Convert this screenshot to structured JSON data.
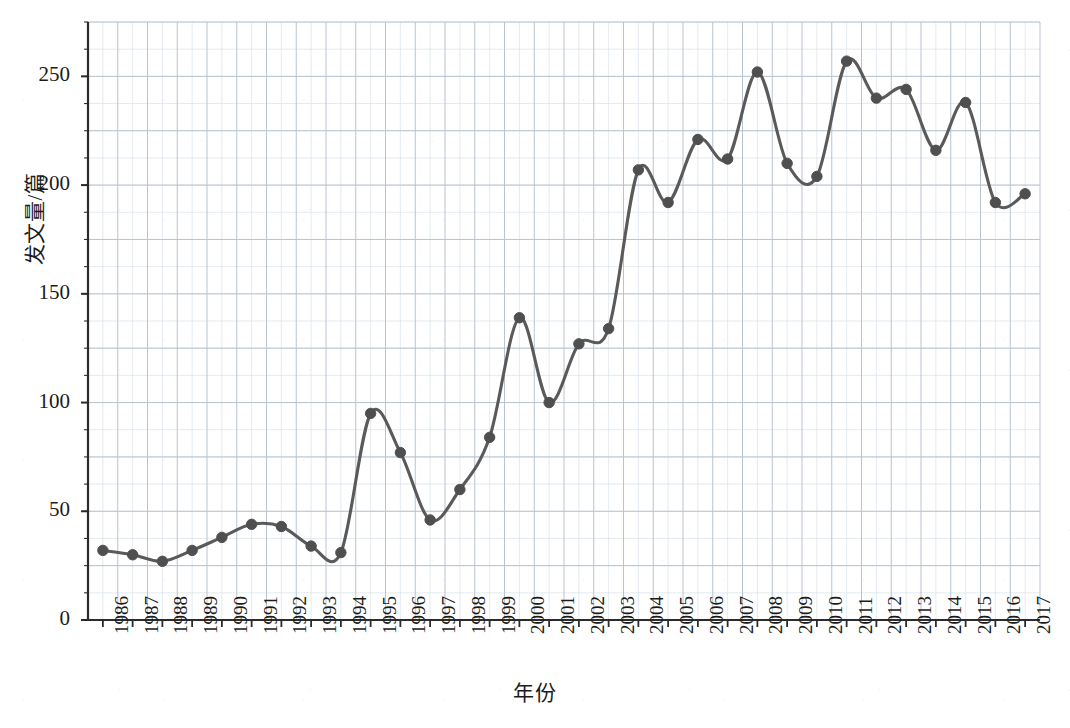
{
  "chart_data": {
    "type": "line",
    "title": "",
    "xlabel": "年份",
    "ylabel": "发文量/篇",
    "xlim": [
      1985.5,
      2017.5
    ],
    "ylim": [
      0,
      275
    ],
    "grid": true,
    "legend": null,
    "yticks": [
      0,
      50,
      100,
      150,
      200,
      250
    ],
    "categories": [
      "1986",
      "1987",
      "1988",
      "1989",
      "1990",
      "1991",
      "1992",
      "1993",
      "1994",
      "1995",
      "1996",
      "1997",
      "1998",
      "1999",
      "2000",
      "2001",
      "2002",
      "2003",
      "2004",
      "2005",
      "2006",
      "2007",
      "2008",
      "2009",
      "2010",
      "2011",
      "2012",
      "2013",
      "2014",
      "2015",
      "2016",
      "2017"
    ],
    "x": [
      1986,
      1987,
      1988,
      1989,
      1990,
      1991,
      1992,
      1993,
      1994,
      1995,
      1996,
      1997,
      1998,
      1999,
      2000,
      2001,
      2002,
      2003,
      2004,
      2005,
      2006,
      2007,
      2008,
      2009,
      2010,
      2011,
      2012,
      2013,
      2014,
      2015,
      2016,
      2017
    ],
    "values": [
      32,
      30,
      27,
      32,
      38,
      44,
      43,
      34,
      31,
      95,
      77,
      46,
      60,
      84,
      139,
      100,
      127,
      134,
      207,
      192,
      221,
      212,
      252,
      210,
      204,
      257,
      240,
      244,
      216,
      238,
      192,
      196
    ],
    "series": [
      {
        "name": "发文量",
        "color": "#5a5a5a",
        "marker": "circle",
        "values": [
          32,
          30,
          27,
          32,
          38,
          44,
          43,
          34,
          31,
          95,
          77,
          46,
          60,
          84,
          139,
          100,
          127,
          134,
          207,
          192,
          221,
          212,
          252,
          210,
          204,
          257,
          240,
          244,
          216,
          238,
          192,
          196
        ]
      }
    ]
  },
  "axes": {
    "y_tick_labels": [
      "0",
      "50",
      "100",
      "150",
      "200",
      "250"
    ],
    "x_tick_labels": [
      "1986",
      "1987",
      "1988",
      "1989",
      "1990",
      "1991",
      "1992",
      "1993",
      "1994",
      "1995",
      "1996",
      "1997",
      "1998",
      "1999",
      "2000",
      "2001",
      "2002",
      "2003",
      "2004",
      "2005",
      "2006",
      "2007",
      "2008",
      "2009",
      "2010",
      "2011",
      "2012",
      "2013",
      "2014",
      "2015",
      "2016",
      "2017"
    ],
    "y_axis_title": "发文量/篇",
    "x_axis_title": "年份"
  },
  "style": {
    "line_color": "#5a5a5a",
    "marker_color": "#4f4f4f",
    "grid_major_color": "#b9c4cf",
    "grid_minor_color": "#d9e2ea",
    "axis_color": "#2b2b2b",
    "background": "#ffffff"
  }
}
